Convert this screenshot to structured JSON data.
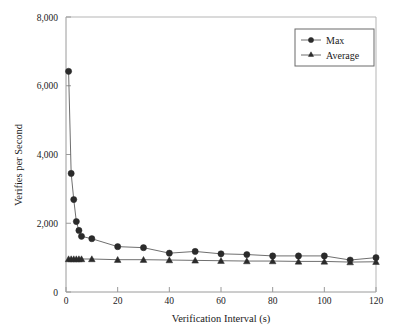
{
  "chart_data": {
    "type": "line",
    "title": "",
    "xlabel": "Verification Interval (s)",
    "ylabel": "Verifies per Second",
    "xlim": [
      0,
      120
    ],
    "ylim": [
      0,
      8000
    ],
    "xticks": [
      0,
      20,
      40,
      60,
      80,
      100,
      120
    ],
    "xtick_labels": [
      "0",
      "20",
      "40",
      "60",
      "80",
      "100",
      "120"
    ],
    "yticks": [
      0,
      2000,
      4000,
      6000,
      8000
    ],
    "ytick_labels": [
      "0",
      "2,000",
      "4,000",
      "6,000",
      "8,000"
    ],
    "grid": false,
    "legend_position": "upper-right",
    "x": [
      1,
      2,
      3,
      4,
      5,
      6,
      10,
      20,
      30,
      40,
      50,
      60,
      70,
      80,
      90,
      100,
      110,
      120
    ],
    "series": [
      {
        "name": "Max",
        "marker": "circle",
        "values": [
          6420,
          3450,
          2690,
          2050,
          1790,
          1620,
          1550,
          1320,
          1290,
          1130,
          1180,
          1110,
          1090,
          1050,
          1050,
          1050,
          930,
          1000
        ]
      },
      {
        "name": "Average",
        "marker": "triangle",
        "values": [
          960,
          960,
          960,
          960,
          960,
          960,
          960,
          940,
          940,
          930,
          920,
          910,
          900,
          900,
          890,
          890,
          870,
          880
        ]
      }
    ],
    "legend": [
      {
        "label": "Max",
        "marker": "circle"
      },
      {
        "label": "Average",
        "marker": "triangle"
      }
    ],
    "colors": {
      "marker": "#2b2b2b",
      "line": "#6f6f6f",
      "axis": "#9a9a9a",
      "text": "#1a1a1a",
      "background": "#ffffff"
    }
  }
}
